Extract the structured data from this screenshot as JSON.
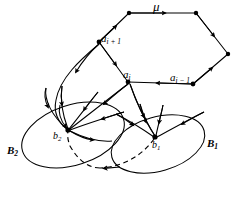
{
  "figure": {
    "background_color": "#ffffff",
    "stroke_color": "#000000",
    "labels": {
      "mu": {
        "text": "μ",
        "base": "μ",
        "sub": ""
      },
      "a_i_plus_1": {
        "base": "a",
        "sub": "i + 1"
      },
      "a_i": {
        "base": "a",
        "sub": "i"
      },
      "a_i_minus_1": {
        "base": "a",
        "sub": "i − 1"
      },
      "b_2": {
        "base": "b",
        "sub": "2"
      },
      "b_1": {
        "base": "b",
        "sub": "1"
      },
      "B_2": {
        "base": "B",
        "sub": "2"
      },
      "B_1": {
        "base": "B",
        "sub": "1"
      }
    },
    "nodes": [
      {
        "name": "hex-top-left",
        "x": 129,
        "y": 13
      },
      {
        "name": "hex-top-right",
        "x": 196,
        "y": 13
      },
      {
        "name": "hex-right",
        "x": 228,
        "y": 54
      },
      {
        "name": "a-i-minus-1",
        "x": 193,
        "y": 84
      },
      {
        "name": "a-i",
        "x": 128,
        "y": 82
      },
      {
        "name": "a-i-plus-1",
        "x": 99,
        "y": 42
      },
      {
        "name": "b-2",
        "x": 68,
        "y": 130
      },
      {
        "name": "b-1",
        "x": 155,
        "y": 137
      }
    ],
    "ellipses": [
      {
        "name": "ellipse-B2",
        "cx": 73,
        "cy": 135,
        "rx": 53,
        "ry": 30,
        "rotate": -18
      },
      {
        "name": "ellipse-B1",
        "cx": 158,
        "cy": 144,
        "rx": 48,
        "ry": 27,
        "rotate": -16
      }
    ],
    "dashed_arrow": {
      "from": "b-1",
      "to": "b-2",
      "style": "dashed"
    }
  }
}
